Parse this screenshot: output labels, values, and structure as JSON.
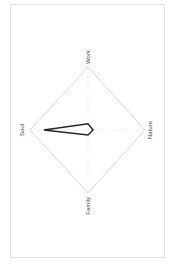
{
  "chart_data": {
    "type": "radar",
    "title": "",
    "orientation": "rotated 90° counterclockwise",
    "axes": [
      "Work",
      "Nature",
      "Family",
      "Soul"
    ],
    "series": [
      {
        "name": "",
        "values": [
          0.1,
          0.09,
          0.08,
          0.76
        ],
        "color": "#222222"
      }
    ],
    "range": [
      0,
      1
    ],
    "grid": true,
    "grid_color": "#cccccc",
    "legend": null
  },
  "labels": {
    "top": "Work",
    "right": "Nature",
    "bottom": "Family",
    "left": "Soul"
  }
}
